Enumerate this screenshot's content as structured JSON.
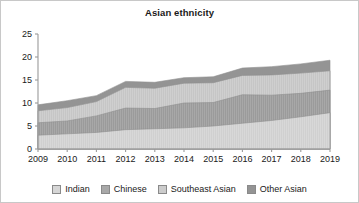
{
  "chart_data": {
    "type": "area",
    "stacked": true,
    "title": "Asian ethnicity",
    "xlabel": "",
    "ylabel": "",
    "categories": [
      "2009",
      "2010",
      "2011",
      "2012",
      "2013",
      "2014",
      "2015",
      "2016",
      "2017",
      "2018",
      "2019"
    ],
    "x": [
      2009,
      2010,
      2011,
      2012,
      2013,
      2014,
      2015,
      2016,
      2017,
      2018,
      2019
    ],
    "xlim": [
      2009,
      2019
    ],
    "ylim": [
      0,
      25
    ],
    "yticks": [
      0,
      5,
      10,
      15,
      20,
      25
    ],
    "ytick_labels": [
      "0",
      "5",
      "10",
      "15",
      "20",
      "25"
    ],
    "grid": false,
    "legend_position": "bottom",
    "series": [
      {
        "name": "Indian",
        "color": "#d6d6d6",
        "values": [
          3.0,
          3.3,
          3.6,
          4.2,
          4.4,
          4.6,
          5.0,
          5.6,
          6.2,
          7.0,
          7.9
        ]
      },
      {
        "name": "Chinese",
        "color": "#a8a8a8",
        "values": [
          2.7,
          2.8,
          3.6,
          4.7,
          4.4,
          5.4,
          5.1,
          6.2,
          5.5,
          5.1,
          4.9
        ]
      },
      {
        "name": "Southeast Asian",
        "color": "#cccccc",
        "values": [
          2.6,
          2.9,
          3.1,
          4.5,
          4.4,
          4.3,
          4.3,
          4.2,
          4.4,
          4.4,
          4.2
        ]
      },
      {
        "name": "Other Asian",
        "color": "#949494",
        "values": [
          1.3,
          1.5,
          1.3,
          1.3,
          1.3,
          1.2,
          1.3,
          1.6,
          1.8,
          2.0,
          2.3
        ]
      }
    ],
    "cumulative_tops": {
      "Indian": [
        3.0,
        3.3,
        3.6,
        4.2,
        4.4,
        4.6,
        5.0,
        5.6,
        6.2,
        7.0,
        7.9
      ],
      "Chinese": [
        5.7,
        6.1,
        7.2,
        8.9,
        8.8,
        10.0,
        10.1,
        11.8,
        11.7,
        12.1,
        12.8
      ],
      "Southeast Asian": [
        8.3,
        9.0,
        10.3,
        13.4,
        13.2,
        14.3,
        14.4,
        16.0,
        16.1,
        16.5,
        17.0
      ],
      "Other Asian": [
        9.6,
        10.5,
        11.6,
        14.7,
        14.5,
        15.5,
        15.7,
        17.6,
        17.9,
        18.5,
        19.3
      ]
    }
  },
  "legend": {
    "items": [
      {
        "label": "Indian",
        "color": "#d6d6d6"
      },
      {
        "label": "Chinese",
        "color": "#a8a8a8"
      },
      {
        "label": "Southeast Asian",
        "color": "#cccccc"
      },
      {
        "label": "Other Asian",
        "color": "#949494"
      }
    ]
  }
}
